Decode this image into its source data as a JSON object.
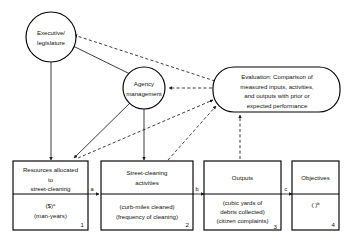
{
  "diagram": {
    "type": "flow-diagram",
    "nodes": {
      "executive": {
        "shape": "circle",
        "lines": [
          "Executive/",
          "legislature"
        ]
      },
      "agency": {
        "shape": "circle",
        "lines": [
          "Agency",
          "management"
        ]
      },
      "evaluation": {
        "shape": "rounded-rectangle",
        "lines": [
          "Evaluation: Comparison of",
          "measured inputs, activities,",
          "and outputs with prior or",
          "expected performance"
        ]
      },
      "box1": {
        "shape": "rectangle",
        "number": "1",
        "top_lines": [
          "Resources allocated",
          "to",
          "street-cleaning"
        ],
        "bottom_lines": [
          "($)",
          "(man-years)"
        ],
        "bottom_superscript": "a"
      },
      "box2": {
        "shape": "rectangle",
        "number": "2",
        "top_lines": [
          "Street-cleaning",
          "activities"
        ],
        "bottom_lines": [
          "(curb-miles cleaned)",
          "(frequency of cleaning)"
        ],
        "bottom_superscript": ""
      },
      "box3": {
        "shape": "rectangle",
        "number": "3",
        "top_lines": [
          "Outputs"
        ],
        "bottom_lines": [
          "(cubic yards of",
          "debris collected)",
          "(citizen complaints)"
        ],
        "bottom_superscript": ""
      },
      "box4": {
        "shape": "rectangle",
        "number": "4",
        "top_lines": [
          "Objectives"
        ],
        "bottom_lines": [
          "(        )"
        ],
        "bottom_superscript": "b"
      }
    },
    "edge_labels": {
      "a": "a",
      "b": "b",
      "c": "c"
    },
    "colors": {
      "stroke": "#000000",
      "background": "#ffffff",
      "text": "#111111"
    }
  }
}
